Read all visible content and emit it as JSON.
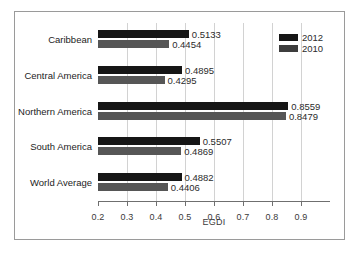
{
  "chart_data": {
    "type": "bar",
    "orientation": "horizontal",
    "title": "",
    "xlabel": "EGDI",
    "ylabel": "",
    "xlim": [
      0.2,
      1.0
    ],
    "xticks": [
      "0.2",
      "0.3",
      "0.4",
      "0.5",
      "0.6",
      "0.7",
      "0.8",
      "0.9"
    ],
    "xtick_values": [
      0.2,
      0.3,
      0.4,
      0.5,
      0.6,
      0.7,
      0.8,
      0.9
    ],
    "grid": true,
    "legend_position": "top-right",
    "categories": [
      "Caribbean",
      "Central America",
      "Northern America",
      "South America",
      "World Average"
    ],
    "series": [
      {
        "name": "2012",
        "color": "#161616",
        "values": [
          0.5133,
          0.4895,
          0.8559,
          0.5507,
          0.4882
        ],
        "labels": [
          "0.5133",
          "0.4895",
          "0.8559",
          "0.5507",
          "0.4882"
        ]
      },
      {
        "name": "2010",
        "color": "#565656",
        "values": [
          0.4454,
          0.4295,
          0.8479,
          0.4869,
          0.4406
        ],
        "labels": [
          "0.4454",
          "0.4295",
          "0.8479",
          "0.4869",
          "0.4406"
        ]
      }
    ]
  }
}
